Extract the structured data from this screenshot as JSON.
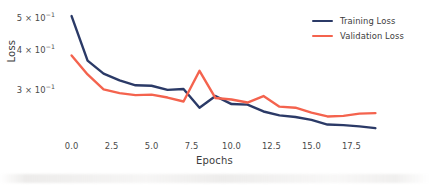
{
  "chart_data": {
    "type": "line",
    "title": "",
    "xlabel": "Epochs",
    "ylabel": "Loss",
    "yscale": "log",
    "xlim": [
      -0.6,
      19.6
    ],
    "ylim": [
      0.215,
      0.525
    ],
    "grid": false,
    "legend_position": "upper right",
    "xticks": [
      "0.0",
      "2.5",
      "5.0",
      "7.5",
      "10.0",
      "12.5",
      "15.0",
      "17.5"
    ],
    "xtick_values": [
      0,
      2.5,
      5,
      7.5,
      10,
      12.5,
      15,
      17.5
    ],
    "ytick_values": [
      0.5,
      0.4,
      0.3
    ],
    "yticks": [
      {
        "mantissa": "5",
        "times": "×",
        "base": "10",
        "exponent": "−1",
        "value": 0.5
      },
      {
        "mantissa": "4",
        "times": "×",
        "base": "10",
        "exponent": "−1",
        "value": 0.4
      },
      {
        "mantissa": "3",
        "times": "×",
        "base": "10",
        "exponent": "−1",
        "value": 0.3
      }
    ],
    "x": [
      0,
      1,
      2,
      3,
      4,
      5,
      6,
      7,
      8,
      9,
      10,
      11,
      12,
      13,
      14,
      15,
      16,
      17,
      18,
      19
    ],
    "series": [
      {
        "name": "Training Loss",
        "color": "#2b3a67",
        "values": [
          0.51,
          0.371,
          0.338,
          0.322,
          0.311,
          0.31,
          0.301,
          0.303,
          0.265,
          0.288,
          0.272,
          0.271,
          0.258,
          0.251,
          0.248,
          0.243,
          0.235,
          0.234,
          0.232,
          0.229
        ]
      },
      {
        "name": "Validation Loss",
        "color": "#f4634e",
        "values": [
          0.385,
          0.336,
          0.302,
          0.294,
          0.29,
          0.291,
          0.285,
          0.277,
          0.345,
          0.284,
          0.281,
          0.275,
          0.288,
          0.267,
          0.265,
          0.256,
          0.249,
          0.25,
          0.254,
          0.255
        ]
      }
    ]
  },
  "legend": {
    "items": [
      {
        "label": "Training Loss",
        "color": "#2b3a67"
      },
      {
        "label": "Validation Loss",
        "color": "#f4634e"
      }
    ]
  },
  "axes": {
    "x_title": "Epochs",
    "y_title": "Loss"
  }
}
